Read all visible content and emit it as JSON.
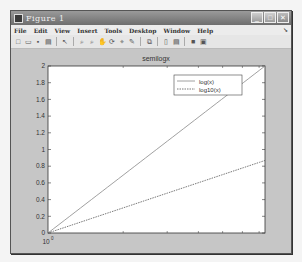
{
  "window": {
    "title": "Figure 1",
    "controls": {
      "minimize": "_",
      "maximize": "□",
      "close": "✕"
    }
  },
  "menubar": {
    "items": [
      "File",
      "Edit",
      "View",
      "Insert",
      "Tools",
      "Desktop",
      "Window",
      "Help"
    ],
    "overflow_arrow": "↘"
  },
  "toolbar": {
    "buttons": [
      {
        "name": "new-figure-icon",
        "glyph": "□"
      },
      {
        "name": "open-file-icon",
        "glyph": "▭"
      },
      {
        "name": "save-icon",
        "glyph": "▪"
      },
      {
        "name": "print-icon",
        "glyph": "▤"
      },
      {
        "name": "edit-plot-icon",
        "glyph": "↖"
      },
      {
        "name": "zoom-in-icon",
        "glyph": "⌕"
      },
      {
        "name": "zoom-out-icon",
        "glyph": "⌕"
      },
      {
        "name": "pan-icon",
        "glyph": "✋"
      },
      {
        "name": "rotate-3d-icon",
        "glyph": "⟳"
      },
      {
        "name": "data-cursor-icon",
        "glyph": "⌖"
      },
      {
        "name": "brush-icon",
        "glyph": "✎"
      },
      {
        "name": "link-plot-icon",
        "glyph": "⧉"
      },
      {
        "name": "insert-colorbar-icon",
        "glyph": "▯"
      },
      {
        "name": "insert-legend-icon",
        "glyph": "▤"
      },
      {
        "name": "hide-plot-tools-icon",
        "glyph": "■"
      },
      {
        "name": "show-plot-tools-icon",
        "glyph": "▣"
      }
    ]
  },
  "chart_data": {
    "type": "line",
    "title": "semilogx",
    "xscale": "log",
    "xlabel": "",
    "ylabel": "",
    "x": [
      1,
      10,
      100
    ],
    "x_tick_label_visible": "10^0",
    "yticks": [
      0,
      0.2,
      0.4,
      0.6,
      0.8,
      1,
      1.2,
      1.4,
      1.6,
      1.8,
      2
    ],
    "ylim": [
      0,
      2
    ],
    "series": [
      {
        "name": "log(x)",
        "style": "solid",
        "color": "#888888",
        "x": [
          1,
          7.39
        ],
        "y": [
          0,
          2.0
        ]
      },
      {
        "name": "log10(x)",
        "style": "dotted",
        "color": "#555555",
        "x": [
          1,
          7.39
        ],
        "y": [
          0,
          0.87
        ]
      }
    ],
    "legend": {
      "position": "northeast",
      "entries": [
        "log(x)",
        "log10(x)"
      ]
    },
    "grid": false
  }
}
